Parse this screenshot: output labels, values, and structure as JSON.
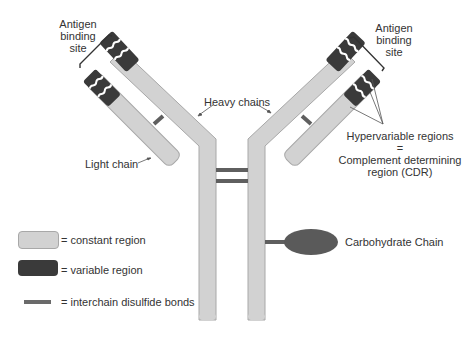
{
  "colors": {
    "constant": "#d2d2d2",
    "constant_border": "#a8a8a8",
    "variable": "#3a3a3a",
    "bond": "#5f5f5f",
    "carbohydrate": "#5a5a5a",
    "text": "#333333",
    "pointer": "#555555"
  },
  "labels": {
    "antigen_left": [
      "Antigen",
      "binding",
      "site"
    ],
    "antigen_right": [
      "Antigen",
      "binding",
      "site"
    ],
    "heavy_chains": "Heavy chains",
    "light_chain": "Light chain",
    "hypervariable": "Hypervariable regions",
    "equals": "=",
    "cdr_line1": "Complement determining",
    "cdr_line2": "region (CDR)",
    "carbohydrate": "Carbohydrate Chain"
  },
  "legend": {
    "items": [
      {
        "swatch": "constant",
        "label": "= constant region"
      },
      {
        "swatch": "variable",
        "label": "= variable region"
      },
      {
        "swatch": "bond",
        "label": "= interchain disulfide bonds"
      }
    ]
  }
}
